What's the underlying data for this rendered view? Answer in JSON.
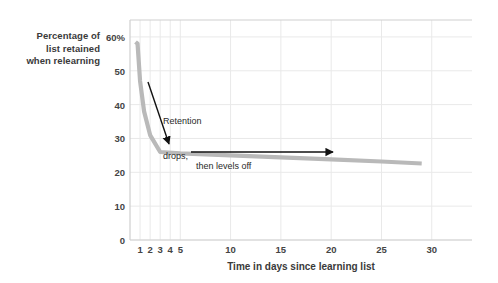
{
  "chart_data": {
    "type": "line",
    "title": "",
    "subtitle": "",
    "xlabel": "Time in days since learning list",
    "ylabel": "Percentage of\nlist retained\nwhen relearning",
    "ylabel_lines": [
      "Percentage of",
      "list retained",
      "when relearning"
    ],
    "xlim": [
      0,
      34
    ],
    "ylim": [
      0,
      65
    ],
    "grid": true,
    "legend": "none",
    "x_ticks": [
      1,
      2,
      3,
      4,
      5,
      10,
      15,
      20,
      25,
      30
    ],
    "x_tick_labels": [
      "1",
      "2",
      "3",
      "4",
      "5",
      "10",
      "15",
      "20",
      "25",
      "30"
    ],
    "y_ticks": [
      0,
      10,
      20,
      30,
      40,
      50,
      60
    ],
    "y_tick_labels": [
      "0",
      "10",
      "20",
      "30",
      "40",
      "50",
      "60%"
    ],
    "series": [
      {
        "name": "retention",
        "color": "#b9b9b9",
        "x": [
          0.55,
          0.75,
          1.0,
          1.4,
          2.0,
          3.0,
          5.0,
          10.0,
          15.0,
          20.0,
          25.0,
          29.0
        ],
        "values": [
          58.5,
          58.0,
          47.0,
          38.0,
          31.0,
          26.0,
          25.6,
          25.0,
          24.4,
          23.8,
          23.2,
          22.6
        ]
      }
    ],
    "annotations": [
      {
        "id": "retention-drops",
        "text": "Retention\ndrops,",
        "lines": [
          "Retention",
          "drops,"
        ],
        "arrow": "diagonal-down-right",
        "arrow_from_xy": [
          148,
          82
        ],
        "arrow_to_xy": [
          169,
          144
        ]
      },
      {
        "id": "then-levels-off",
        "text": "then levels off",
        "lines": [
          "then levels off"
        ],
        "arrow": "horizontal-right",
        "arrow_from_xy": [
          191,
          152
        ],
        "arrow_to_xy": [
          333,
          152
        ]
      }
    ],
    "colors": {
      "curve": "#b9b9b9",
      "grid": "#e9e9e9",
      "axis": "#cfcfcf",
      "text": "#3a3a3a",
      "annotation_arrow": "#111111",
      "background": "#ffffff"
    }
  }
}
